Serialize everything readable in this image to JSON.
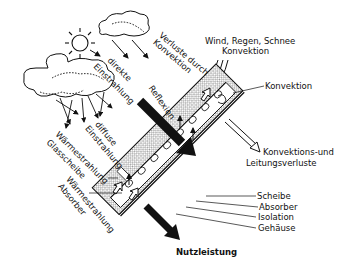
{
  "diagram": {
    "labels": {
      "top_right_weather": "Wind, Regen, Schnee",
      "top_right_convection": "Konvektion",
      "losses_convection_line1": "Verluste durch",
      "losses_convection_line2": "Konvektion",
      "direct_line1": "direkte",
      "direct_line2": "Einstrahlung",
      "reflection": "Reflexion",
      "diffuse_line1": "diffuse",
      "diffuse_line2": "Einstrahlung",
      "heat_glass_line1": "Wärmestrahlung",
      "heat_glass_line2": "Glasscheibe",
      "heat_absorber_line1": "Wärmestrahlung",
      "heat_absorber_line2": "Absorber",
      "convection_right": "Konvektion",
      "conduction_losses_line1": "Konvektions-und",
      "conduction_losses_line2": "Leitungsverluste",
      "layer_pane": "Scheibe",
      "layer_absorber": "Absorber",
      "layer_insulation": "Isolation",
      "layer_housing": "Gehäuse",
      "useful_output": "Nutzleistung"
    },
    "icons": [
      "sun-icon",
      "cloud-icon",
      "cloud-icon",
      "arrow-icon"
    ],
    "colors": {
      "ink": "#111111",
      "background": "#ffffff",
      "hatch": "#888888"
    }
  }
}
